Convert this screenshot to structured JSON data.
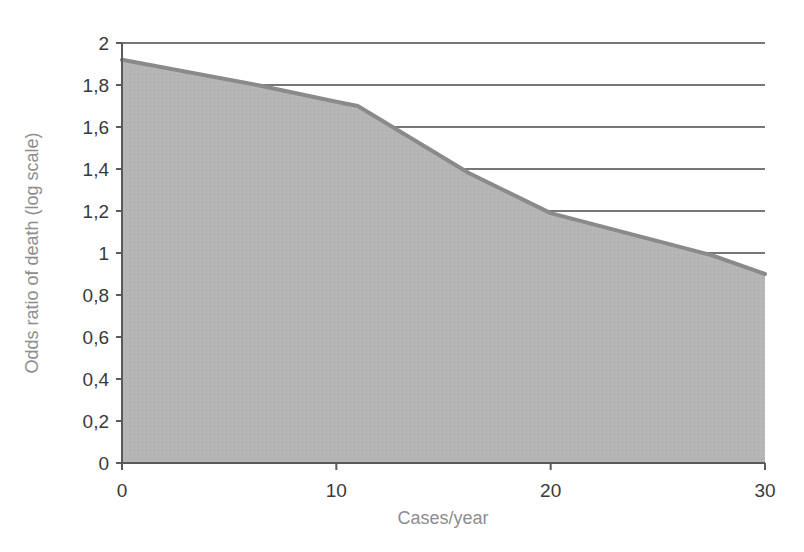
{
  "chart_data": {
    "type": "area",
    "title": "",
    "subtitle": "",
    "xlabel": "Cases/year",
    "ylabel": "Odds ratio of death (log scale)",
    "xlim": [
      0,
      30
    ],
    "ylim": [
      0,
      2
    ],
    "grid": true,
    "legend": null,
    "legend_position": "none",
    "x_ticks": [
      "0",
      "10",
      "20",
      "30"
    ],
    "x_tick_values": [
      0,
      10,
      20,
      30
    ],
    "y_ticks": [
      "0",
      "0,2",
      "0,4",
      "0,6",
      "0,8",
      "1",
      "1,2",
      "1,4",
      "1,6",
      "1,8",
      "2"
    ],
    "y_tick_values": [
      0,
      0.2,
      0.4,
      0.6,
      0.8,
      1,
      1.2,
      1.4,
      1.6,
      1.8,
      2
    ],
    "y_gridline_values": [
      1,
      1.2,
      1.4,
      1.6,
      1.8,
      2
    ],
    "decimal_separator": ",",
    "series": [
      {
        "name": "Odds ratio of death",
        "x": [
          0,
          6.3,
          10,
          11,
          16.2,
          20,
          27.5,
          30
        ],
        "values": [
          1.92,
          1.8,
          1.72,
          1.7,
          1.38,
          1.19,
          0.99,
          0.9
        ],
        "fill_color": "#b5b5b5",
        "line_color": "#8a8a8a"
      }
    ],
    "colors": {
      "area_fill": "#b5b5b5",
      "line": "#8a8a8a",
      "axis": "#5a5a5a",
      "gridline": "#4a4a4a",
      "tick_text": "#3a3a3a",
      "axis_title_text": "#8d8d8d",
      "background": "#ffffff"
    }
  }
}
